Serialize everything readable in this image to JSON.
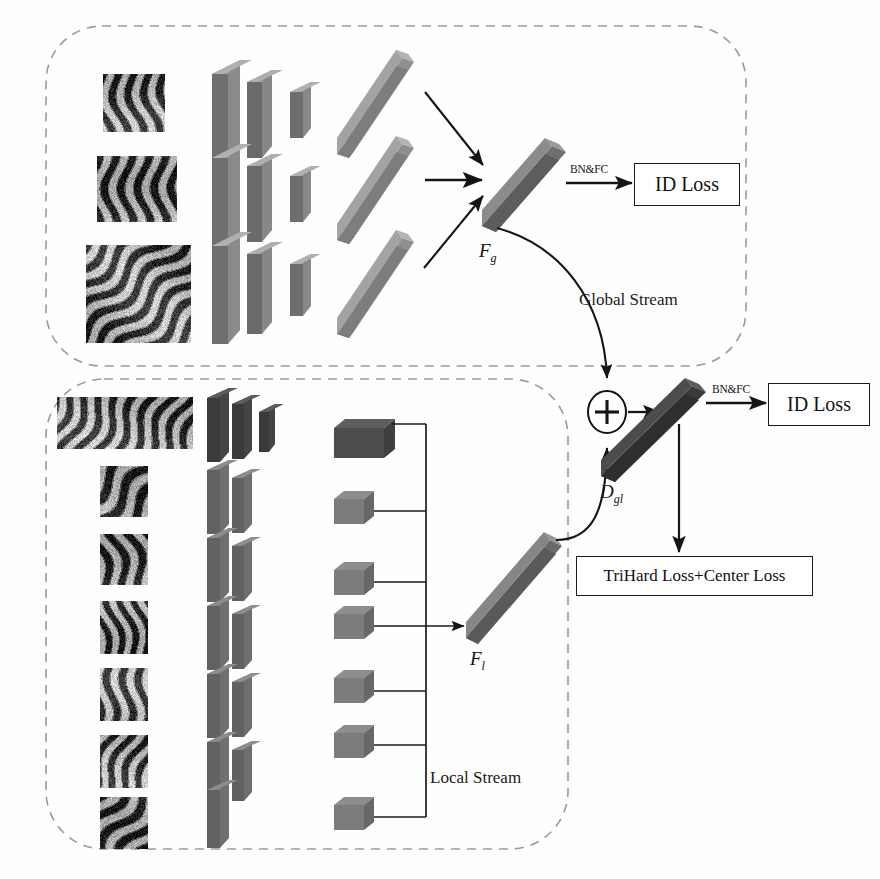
{
  "figure": {
    "background": "#fefefe",
    "width": 880,
    "height": 879
  },
  "colors": {
    "dashed_border": "#9a9a9a",
    "arrow": "#151515",
    "slab_face_dark": "#4a4a4a",
    "slab_face_mid": "#7d7d7d",
    "slab_face_light": "#9b9b9b",
    "bar_global": "#707070",
    "bar_local": "#6a6a6a",
    "bar_dgl": "#3a3a3a",
    "box_feature_dark": "#4b4b4b",
    "box_feature_mid": "#7b7b7b",
    "text": "#111111",
    "loss_box_border": "#1a1a1a"
  },
  "global_stream": {
    "label": "Global Stream",
    "feature_label": "F",
    "feature_sub": "g",
    "bnfc_label": "BN&FC",
    "loss_label": "ID Loss",
    "branches": [
      {
        "name": "branch-top",
        "image_name": "tiger-image-1"
      },
      {
        "name": "branch-middle",
        "image_name": "tiger-image-2"
      },
      {
        "name": "branch-bottom",
        "image_name": "tiger-image-3"
      }
    ],
    "cnn_layers": [
      "conv-block-large",
      "conv-block-medium",
      "conv-block-small",
      "feature-bar"
    ]
  },
  "local_stream": {
    "label": "Local Stream",
    "feature_label": "F",
    "feature_sub": "l",
    "parts": [
      {
        "name": "part-stripe-full",
        "image_name": "tiger-stripe-strip"
      },
      {
        "name": "part-1",
        "image_name": "tiger-patch-1"
      },
      {
        "name": "part-2",
        "image_name": "tiger-patch-2"
      },
      {
        "name": "part-3",
        "image_name": "tiger-patch-3"
      },
      {
        "name": "part-4",
        "image_name": "tiger-patch-4"
      },
      {
        "name": "part-5",
        "image_name": "tiger-patch-5"
      },
      {
        "name": "part-6",
        "image_name": "tiger-patch-6"
      }
    ],
    "cnn_layers": [
      "conv-block-a",
      "conv-block-b",
      "conv-block-c"
    ]
  },
  "fusion": {
    "operator": "+",
    "operator_name": "addition-operator",
    "feature_label": "D",
    "feature_sub": "gl",
    "bnfc_label": "BN&FC",
    "id_loss_label": "ID Loss",
    "metric_loss_label": "TriHard Loss+Center Loss"
  }
}
